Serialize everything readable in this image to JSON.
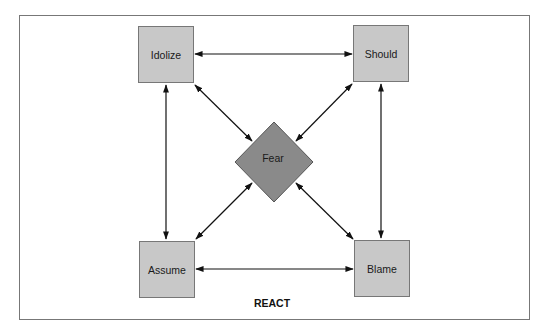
{
  "diagram": {
    "caption": "REACT",
    "center": {
      "label": "Fear",
      "shape": "diamond",
      "color": "#8a8a8a"
    },
    "nodes": [
      {
        "id": "idolize",
        "label": "Idolize",
        "position": "top-left"
      },
      {
        "id": "should",
        "label": "Should",
        "position": "top-right"
      },
      {
        "id": "assume",
        "label": "Assume",
        "position": "bottom-left"
      },
      {
        "id": "blame",
        "label": "Blame",
        "position": "bottom-right"
      }
    ],
    "edges": [
      {
        "from": "Idolize",
        "to": "Should",
        "type": "bidirectional"
      },
      {
        "from": "Assume",
        "to": "Blame",
        "type": "bidirectional"
      },
      {
        "from": "Idolize",
        "to": "Assume",
        "type": "bidirectional"
      },
      {
        "from": "Should",
        "to": "Blame",
        "type": "bidirectional"
      },
      {
        "from": "Idolize",
        "to": "Fear",
        "type": "bidirectional"
      },
      {
        "from": "Should",
        "to": "Fear",
        "type": "bidirectional"
      },
      {
        "from": "Assume",
        "to": "Fear",
        "type": "bidirectional"
      },
      {
        "from": "Blame",
        "to": "Fear",
        "type": "bidirectional"
      }
    ],
    "box_color": "#c8c8c8"
  }
}
